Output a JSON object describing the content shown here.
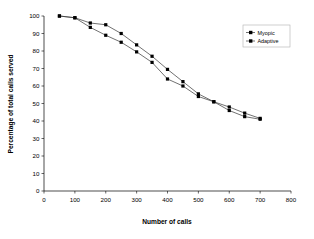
{
  "chart_data": {
    "type": "line",
    "title": "",
    "xlabel": "Number of calls",
    "ylabel": "Percentage of total calls served",
    "xlim": [
      0,
      800
    ],
    "ylim": [
      0,
      100
    ],
    "xticks": [
      0,
      100,
      200,
      300,
      400,
      500,
      600,
      700,
      800
    ],
    "yticks": [
      0,
      10,
      20,
      30,
      40,
      50,
      60,
      70,
      80,
      90,
      100
    ],
    "grid": false,
    "legend_position": "top-right",
    "marker": "square",
    "line_color": "#333333",
    "marker_color": "#000000",
    "x": [
      50,
      100,
      150,
      200,
      250,
      300,
      350,
      400,
      450,
      500,
      550,
      600,
      650,
      700
    ],
    "series": [
      {
        "name": "Myopic",
        "values": [
          100,
          99,
          96,
          95,
          90,
          83.5,
          77,
          69.5,
          62.5,
          55.5,
          51,
          48,
          44.5,
          41.5
        ]
      },
      {
        "name": "Adaptive",
        "values": [
          100,
          99,
          93.5,
          89,
          85,
          79.5,
          73.5,
          64,
          60,
          54,
          51,
          46,
          42.5,
          41
        ]
      }
    ]
  },
  "axes": {
    "x_title": "Number of calls",
    "y_title": "Percentage of total calls served",
    "x_tick_labels": [
      "0",
      "100",
      "200",
      "300",
      "400",
      "500",
      "600",
      "700",
      "800"
    ],
    "y_tick_labels": [
      "0",
      "10",
      "20",
      "30",
      "40",
      "50",
      "60",
      "70",
      "80",
      "90",
      "100"
    ]
  },
  "legend": {
    "items": [
      {
        "label": "Myopic",
        "marker": "square-marker"
      },
      {
        "label": "Adaptive",
        "marker": "square-marker"
      }
    ]
  }
}
